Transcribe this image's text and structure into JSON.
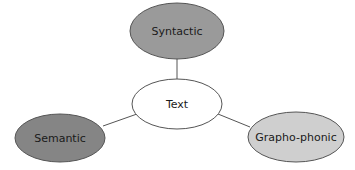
{
  "diagram": {
    "center": {
      "label": "Text",
      "fill": "#ffffff"
    },
    "nodes": [
      {
        "label": "Syntactic",
        "fill": "#9a9a9a"
      },
      {
        "label": "Semantic",
        "fill": "#858585"
      },
      {
        "label": "Grapho-phonic",
        "fill": "#cfcfcf"
      }
    ]
  }
}
